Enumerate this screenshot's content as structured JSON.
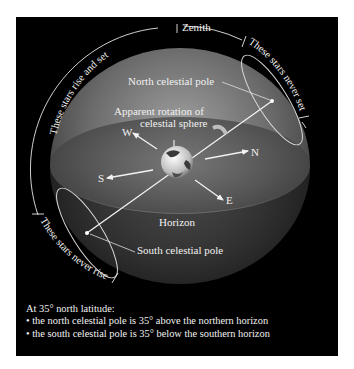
{
  "diagram": {
    "labels": {
      "zenith": "Zenith",
      "north_celestial_pole": "North celestial pole",
      "apparent_rotation_line1": "Apparent rotation of",
      "apparent_rotation_line2": "celestial sphere",
      "west": "W",
      "north": "N",
      "south": "S",
      "east": "E",
      "horizon": "Horizon",
      "south_celestial_pole": "South celestial pole",
      "rise_and_set": "These stars rise and set",
      "never_set": "These stars never set",
      "never_rise": "These stars never rise"
    },
    "icons": {
      "earth": "earth-globe-icon",
      "rotation_arrow": "curved-arrow-icon"
    },
    "colors": {
      "background": "#000000",
      "text": "#f2f2f2",
      "sphere_light": "#8a8a8a",
      "sphere_dark": "#2a2a2a"
    }
  },
  "caption": {
    "heading": "At 35° north latitude:",
    "bullets": [
      "• the north celestial pole is 35° above the northern horizon",
      "• the south celestial pole is 35° below the southern horizon"
    ]
  }
}
